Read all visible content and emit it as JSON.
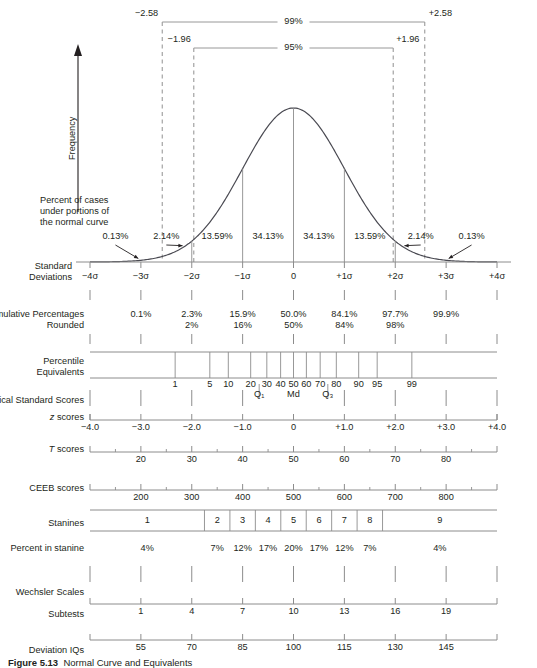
{
  "figure": {
    "caption_number": "Figure 5.13",
    "caption_text": "Normal Curve and Equivalents",
    "y_axis_label": "Frequency",
    "curve_note_lines": [
      "Percent of cases",
      "under portions of",
      "the normal curve"
    ]
  },
  "chart_data": {
    "type": "line",
    "title": "Normal Curve and Equivalents",
    "xlabel": "Standard Deviations",
    "ylabel": "Frequency",
    "xlim": [
      -4,
      4
    ],
    "grid": false,
    "legend": "none",
    "confidence_brackets": [
      {
        "label": "99%",
        "left_label": "−2.58",
        "right_label": "+2.58",
        "z_left": -2.58,
        "z_right": 2.58
      },
      {
        "label": "95%",
        "left_label": "−1.96",
        "right_label": "+1.96",
        "z_left": -1.96,
        "z_right": 1.96
      }
    ],
    "area_percentages": {
      "labels": [
        "0.13%",
        "2.14%",
        "13.59%",
        "34.13%",
        "34.13%",
        "13.59%",
        "2.14%",
        "0.13%"
      ],
      "values": [
        0.13,
        2.14,
        13.59,
        34.13,
        34.13,
        13.59,
        2.14,
        0.13
      ],
      "centers_z": [
        -3.5,
        -2.5,
        -1.5,
        -0.5,
        0.5,
        1.5,
        2.5,
        3.5
      ]
    },
    "scales": [
      {
        "name": "Standard Deviations",
        "label_lines": [
          "Standard",
          "Deviations"
        ],
        "ticks_z": [
          -4,
          -3,
          -2,
          -1,
          0,
          1,
          2,
          3,
          4
        ],
        "tick_labels": [
          "−4σ",
          "−3σ",
          "−2σ",
          "−1σ",
          "0",
          "+1σ",
          "+2σ",
          "+3σ",
          "+4σ"
        ]
      },
      {
        "name": "Cumulative Percentages",
        "label_lines": [
          "Cumulative Percentages",
          "Rounded"
        ],
        "ticks_z": [
          -3,
          -2,
          -1,
          0,
          1,
          2,
          3
        ],
        "tick_labels": [
          "0.1%",
          "2.3%",
          "15.9%",
          "50.0%",
          "84.1%",
          "97.7%",
          "99.9%"
        ],
        "rounded_ticks_z": [
          -2,
          -1,
          0,
          1,
          2
        ],
        "rounded_labels": [
          "2%",
          "16%",
          "50%",
          "84%",
          "98%"
        ]
      },
      {
        "name": "Percentile Equivalents",
        "label_lines": [
          "Percentile",
          "Equivalents"
        ],
        "percentiles": [
          1,
          5,
          10,
          20,
          30,
          40,
          50,
          60,
          70,
          80,
          90,
          95,
          99
        ],
        "tick_labels": [
          "1",
          "5",
          "10",
          "20",
          "30",
          "40",
          "50",
          "60",
          "70",
          "80",
          "90",
          "95",
          "99"
        ],
        "quartile_markers": [
          "Q₁",
          "Md",
          "Q₃"
        ],
        "quartile_percentiles": [
          25,
          50,
          75
        ]
      },
      {
        "name": "Typical Standard Scores",
        "label_lines": [
          "Typical Standard Scores"
        ]
      },
      {
        "name": "z scores",
        "label_prefix": "z",
        "label_suffix": " scores",
        "ticks_z": [
          -4,
          -3,
          -2,
          -1,
          0,
          1,
          2,
          3,
          4
        ],
        "tick_labels": [
          "−4.0",
          "−3.0",
          "−2.0",
          "−1.0",
          "0",
          "+1.0",
          "+2.0",
          "+3.0",
          "+4.0"
        ]
      },
      {
        "name": "T scores",
        "label_prefix": "T",
        "label_suffix": " scores",
        "ticks_z": [
          -3,
          -2,
          -1,
          0,
          1,
          2,
          3
        ],
        "tick_labels": [
          "20",
          "30",
          "40",
          "50",
          "60",
          "70",
          "80"
        ]
      },
      {
        "name": "CEEB scores",
        "label_lines": [
          "CEEB scores"
        ],
        "ticks_z": [
          -3,
          -2,
          -1,
          0,
          1,
          2,
          3
        ],
        "tick_labels": [
          "200",
          "300",
          "400",
          "500",
          "600",
          "700",
          "800"
        ]
      },
      {
        "name": "Stanines",
        "label_lines": [
          "Stanines"
        ],
        "bands": [
          "1",
          "2",
          "3",
          "4",
          "5",
          "6",
          "7",
          "8",
          "9"
        ],
        "band_edges_z": [
          -4,
          -1.75,
          -1.25,
          -0.75,
          -0.25,
          0.25,
          0.75,
          1.25,
          1.75,
          4
        ]
      },
      {
        "name": "Percent in stanine",
        "label_lines": [
          "Percent in stanine"
        ],
        "labels": [
          "4%",
          "7%",
          "12%",
          "17%",
          "20%",
          "17%",
          "12%",
          "7%",
          "4%"
        ],
        "values": [
          4,
          7,
          12,
          17,
          20,
          17,
          12,
          7,
          4
        ]
      },
      {
        "name": "Wechsler Scales",
        "label_lines": [
          "Wechsler Scales"
        ]
      },
      {
        "name": "Subtests",
        "label_lines": [
          "Subtests"
        ],
        "ticks_z": [
          -3,
          -2,
          -1,
          0,
          1,
          2,
          3
        ],
        "tick_labels": [
          "1",
          "4",
          "7",
          "10",
          "13",
          "16",
          "19"
        ]
      },
      {
        "name": "Deviation IQs",
        "label_lines": [
          "Deviation IQs"
        ],
        "ticks_z": [
          -3,
          -2,
          -1,
          0,
          1,
          2,
          3
        ],
        "tick_labels": [
          "55",
          "70",
          "85",
          "100",
          "115",
          "130",
          "145"
        ]
      }
    ]
  },
  "colors": {
    "ink": "#231f20",
    "rule": "#8c8c8c",
    "curve": "#4a4a52",
    "dashed": "#9a9a9a"
  }
}
